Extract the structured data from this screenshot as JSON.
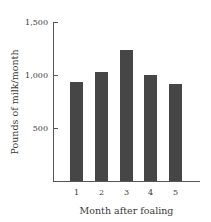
{
  "chart_data": {
    "type": "bar",
    "title": "",
    "xlabel": "Month after foaling",
    "ylabel": "Pounds of milk/month",
    "categories": [
      "1",
      "2",
      "3",
      "4",
      "5"
    ],
    "values": [
      935,
      1030,
      1240,
      1000,
      915
    ],
    "ylim": [
      0,
      1500
    ],
    "yticks": [
      "500",
      "1,000",
      "1,500"
    ],
    "grid": false,
    "legend": null,
    "bar_color": "#464646"
  },
  "labels": {
    "y500": "500",
    "y1000": "1,000",
    "y1500": "1,500",
    "x1": "1",
    "x2": "2",
    "x3": "3",
    "x4": "4",
    "x5": "5",
    "xtitle": "Month after foaling",
    "ytitle": "Pounds of milk/month"
  }
}
